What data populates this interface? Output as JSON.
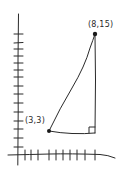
{
  "diagram": {
    "type": "coordinate-plane-right-triangle",
    "style": "hand-drawn",
    "stroke_color": "#2a2a2a",
    "background": "#ffffff",
    "axes": {
      "y_tick_count": 15,
      "x_tick_count": 10
    },
    "points": [
      {
        "name": "A",
        "label": "(3,3)",
        "x": 3,
        "y": 3
      },
      {
        "name": "B",
        "label": "(8,15)",
        "x": 8,
        "y": 15
      }
    ],
    "right_angle_vertex": {
      "x": 8,
      "y": 3
    },
    "labels": {
      "top_point": "(8,15)",
      "bottom_point": "(3,3)"
    }
  }
}
